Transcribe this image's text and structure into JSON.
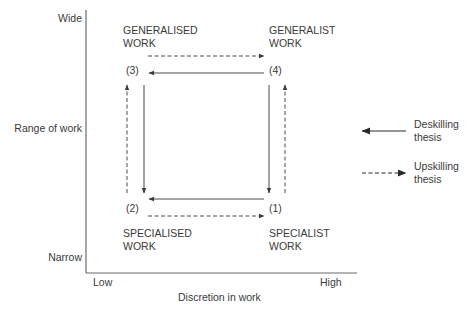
{
  "axes": {
    "y_label": "Range of work",
    "y_top": "Wide",
    "y_bottom": "Narrow",
    "x_label": "Discretion in work",
    "x_left": "Low",
    "x_right": "High"
  },
  "quadrants": {
    "q3": {
      "number": "(3)",
      "line1": "GENERALISED",
      "line2": "WORK"
    },
    "q4": {
      "number": "(4)",
      "line1": "GENERALIST",
      "line2": "WORK"
    },
    "q2": {
      "number": "(2)",
      "line1": "SPECIALISED",
      "line2": "WORK"
    },
    "q1": {
      "number": "(1)",
      "line1": "SPECIALIST",
      "line2": "WORK"
    }
  },
  "legend": {
    "deskilling": {
      "line1": "Deskilling",
      "line2": "thesis",
      "style": "solid"
    },
    "upskilling": {
      "line1": "Upskilling",
      "line2": "thesis",
      "style": "dashed"
    }
  },
  "colors": {
    "line": "#4a4a4a",
    "text": "#3a3a3a",
    "background": "#ffffff"
  }
}
